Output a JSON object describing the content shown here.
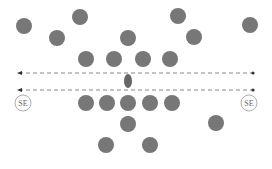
{
  "colors": {
    "dot": "#777777",
    "line": "#888888",
    "label": "#666666",
    "label_ring": "#999999",
    "ellipse": "#666666"
  },
  "dots": [
    {
      "x": 24,
      "y": 26
    },
    {
      "x": 80,
      "y": 17
    },
    {
      "x": 178,
      "y": 16
    },
    {
      "x": 250,
      "y": 25
    },
    {
      "x": 57,
      "y": 38
    },
    {
      "x": 128,
      "y": 38
    },
    {
      "x": 194,
      "y": 37
    },
    {
      "x": 86,
      "y": 59
    },
    {
      "x": 114,
      "y": 59
    },
    {
      "x": 143,
      "y": 59
    },
    {
      "x": 170,
      "y": 59
    },
    {
      "x": 86,
      "y": 103
    },
    {
      "x": 107,
      "y": 103
    },
    {
      "x": 128,
      "y": 103
    },
    {
      "x": 150,
      "y": 103
    },
    {
      "x": 172,
      "y": 103
    },
    {
      "x": 128,
      "y": 124
    },
    {
      "x": 216,
      "y": 123
    },
    {
      "x": 106,
      "y": 145
    },
    {
      "x": 150,
      "y": 145
    }
  ],
  "dot_radius": 8,
  "lines": [
    {
      "y": 73,
      "x1": 19,
      "x2": 253
    },
    {
      "y": 90,
      "x1": 19,
      "x2": 253
    }
  ],
  "center_ellipse": {
    "x": 128,
    "y": 81,
    "rx": 4,
    "ry": 7
  },
  "labels": [
    {
      "text": "SE",
      "x": 23,
      "y": 103
    },
    {
      "text": "SE",
      "x": 249,
      "y": 103
    }
  ]
}
